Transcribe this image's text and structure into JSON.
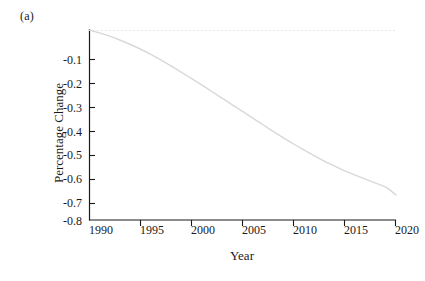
{
  "figure": {
    "panel_label": "(a)",
    "xlabel": "Year",
    "ylabel": "Percentage Change"
  },
  "colors": {
    "axis": "#1a1a1a",
    "curve": "#d8d8d8",
    "zero_line": "#e2e2e2",
    "text": "#1a1a1a",
    "background": "#ffffff"
  },
  "axes": {
    "x_ticks": [
      "1990",
      "1995",
      "2000",
      "2005",
      "2010",
      "2015",
      "2020"
    ],
    "y_ticks": [
      "-0.1",
      "-0.2",
      "-0.3",
      "-0.4",
      "-0.5",
      "-0.6",
      "-0.7",
      "-0.8"
    ],
    "xlim": [
      1990,
      2020
    ],
    "ylim": [
      -0.8,
      0.0
    ],
    "spines": "left-bottom"
  },
  "chart_data": {
    "type": "line",
    "title": "",
    "subtitle": "",
    "xlabel": "Year",
    "ylabel": "Percentage Change",
    "xlim": [
      1990,
      2020
    ],
    "ylim": [
      -0.8,
      0.0
    ],
    "xticks": [
      1990,
      1995,
      2000,
      2005,
      2010,
      2015,
      2020
    ],
    "yticks": [
      -0.8,
      -0.7,
      -0.6,
      -0.5,
      -0.4,
      -0.3,
      -0.2,
      -0.1,
      0.0
    ],
    "grid": false,
    "legend": null,
    "annotations": [
      {
        "text": "(a)",
        "position": "top-left-outside"
      }
    ],
    "reference_lines": [
      {
        "axis": "y",
        "value": 0.0,
        "style": "dotted",
        "color": "#e2e2e2"
      }
    ],
    "series": [
      {
        "name": "Percentage Change",
        "color": "#d8d8d8",
        "linewidth": 1.4,
        "x": [
          1990,
          1991,
          1992,
          1993,
          1994,
          1995,
          1996,
          1997,
          1998,
          1999,
          2000,
          2001,
          2002,
          2003,
          2004,
          2005,
          2006,
          2007,
          2008,
          2009,
          2010,
          2011,
          2012,
          2013,
          2014,
          2015,
          2016,
          2017,
          2018,
          2019,
          2020
        ],
        "values": [
          0.0,
          -0.012,
          -0.026,
          -0.042,
          -0.06,
          -0.08,
          -0.102,
          -0.126,
          -0.151,
          -0.177,
          -0.204,
          -0.231,
          -0.259,
          -0.287,
          -0.315,
          -0.343,
          -0.371,
          -0.399,
          -0.427,
          -0.454,
          -0.48,
          -0.505,
          -0.529,
          -0.552,
          -0.573,
          -0.593,
          -0.611,
          -0.628,
          -0.645,
          -0.662,
          -0.695
        ]
      }
    ]
  }
}
